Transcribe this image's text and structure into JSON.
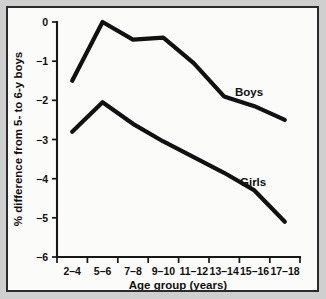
{
  "chart_data": {
    "type": "line",
    "title": "",
    "subtitle": "",
    "xlabel": "Age group (years)",
    "ylabel": "% difference from 5- to 6-y boys",
    "categories": [
      "2–4",
      "5–6",
      "7–8",
      "9–10",
      "11–12",
      "13–14",
      "15–16",
      "17–18"
    ],
    "ylim": [
      -6,
      0
    ],
    "yticks": [
      0,
      -1,
      -2,
      -3,
      -4,
      -5,
      -6
    ],
    "ytick_labels": [
      "0",
      "−1",
      "−2",
      "−3",
      "−4",
      "−5",
      "−6"
    ],
    "grid": false,
    "legend_position": "inline-annotation",
    "series": [
      {
        "name": "Boys",
        "color": "#111111",
        "values": [
          -1.5,
          0.0,
          -0.45,
          -0.4,
          -1.05,
          -1.9,
          -2.15,
          -2.5
        ],
        "annotation": "Boys"
      },
      {
        "name": "Girls",
        "color": "#111111",
        "values": [
          -2.8,
          -2.05,
          -2.6,
          -3.05,
          -3.45,
          -3.85,
          -4.3,
          -5.1
        ],
        "annotation": "Girls"
      }
    ]
  },
  "annotations": {
    "boys_label": "Boys",
    "girls_label": "Girls"
  },
  "axes": {
    "x_title": "Age group (years)",
    "y_title": "% difference from 5- to 6-y boys",
    "x_tick_labels": [
      "2–4",
      "5–6",
      "7–8",
      "9–10",
      "11–12",
      "13–14",
      "15–16",
      "17–18"
    ],
    "y_tick_labels": [
      "0",
      "−1",
      "−2",
      "−3",
      "−4",
      "−5",
      "−6"
    ]
  },
  "colors": {
    "line": "#111111",
    "axis": "#171717",
    "plot_background": "#fbfbfa",
    "figure_background": "#cfcfcf",
    "border": "#2b2b2b"
  }
}
